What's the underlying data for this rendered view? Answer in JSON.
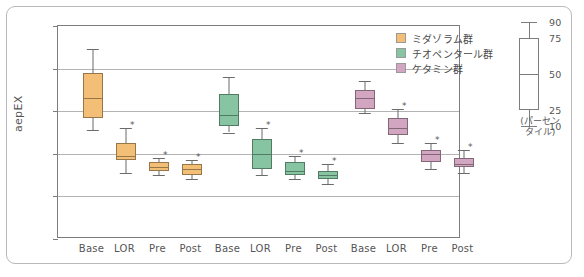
{
  "chart_data": {
    "type": "box",
    "title": "",
    "xlabel": "",
    "ylabel": "aepEX",
    "ylim": [
      0,
      100
    ],
    "yticks": [
      0,
      20,
      40,
      60,
      80,
      100
    ],
    "grid": true,
    "legend_position": "top-right",
    "categories": [
      "Base",
      "LOR",
      "Pre",
      "Post"
    ],
    "significance_marker": "*",
    "series": [
      {
        "name": "ミダゾラム群",
        "color": "#f3bf76",
        "boxes": [
          {
            "category": "Base",
            "whisker_low": 51,
            "q25": 57,
            "median": 66,
            "q75": 78,
            "whisker_high": 89,
            "significant": false
          },
          {
            "category": "LOR",
            "whisker_low": 31,
            "q25": 37,
            "median": 39,
            "q75": 45,
            "whisker_high": 52,
            "significant": true
          },
          {
            "category": "Pre",
            "whisker_low": 30,
            "q25": 32,
            "median": 34,
            "q75": 36,
            "whisker_high": 38,
            "significant": true
          },
          {
            "category": "Post",
            "whisker_low": 28,
            "q25": 30,
            "median": 33,
            "q75": 35,
            "whisker_high": 37,
            "significant": true
          }
        ]
      },
      {
        "name": "チオペンタール群",
        "color": "#86c4a2",
        "boxes": [
          {
            "category": "Base",
            "whisker_low": 50,
            "q25": 53,
            "median": 58,
            "q75": 68,
            "whisker_high": 76,
            "significant": false
          },
          {
            "category": "LOR",
            "whisker_low": 30,
            "q25": 33,
            "median": 40,
            "q75": 47,
            "whisker_high": 52,
            "significant": true
          },
          {
            "category": "Pre",
            "whisker_low": 28,
            "q25": 30,
            "median": 32,
            "q75": 36,
            "whisker_high": 39,
            "significant": true
          },
          {
            "category": "Post",
            "whisker_low": 26,
            "q25": 28,
            "median": 30,
            "q75": 32,
            "whisker_high": 35,
            "significant": true
          }
        ]
      },
      {
        "name": "ケタミン群",
        "color": "#d2a6c0",
        "boxes": [
          {
            "category": "Base",
            "whisker_low": 59,
            "q25": 61,
            "median": 66,
            "q75": 70,
            "whisker_high": 74,
            "significant": false
          },
          {
            "category": "LOR",
            "whisker_low": 45,
            "q25": 49,
            "median": 52,
            "q75": 57,
            "whisker_high": 61,
            "significant": true
          },
          {
            "category": "Pre",
            "whisker_low": 33,
            "q25": 36,
            "median": 40,
            "q75": 42,
            "whisker_high": 45,
            "significant": true
          },
          {
            "category": "Post",
            "whisker_low": 31,
            "q25": 34,
            "median": 35,
            "q75": 38,
            "whisker_high": 42,
            "significant": true
          }
        ]
      }
    ]
  },
  "legend": {
    "items": [
      {
        "label": "ミダゾラム群",
        "color": "#f3bf76"
      },
      {
        "label": "チオペンタール群",
        "color": "#86c4a2"
      },
      {
        "label": "ケタミン群",
        "color": "#d2a6c0"
      }
    ]
  },
  "percentile_key": {
    "labels": [
      "90",
      "75",
      "50",
      "25",
      "10"
    ],
    "caption_line1": "(パーセン",
    "caption_line2": "タイル)"
  }
}
